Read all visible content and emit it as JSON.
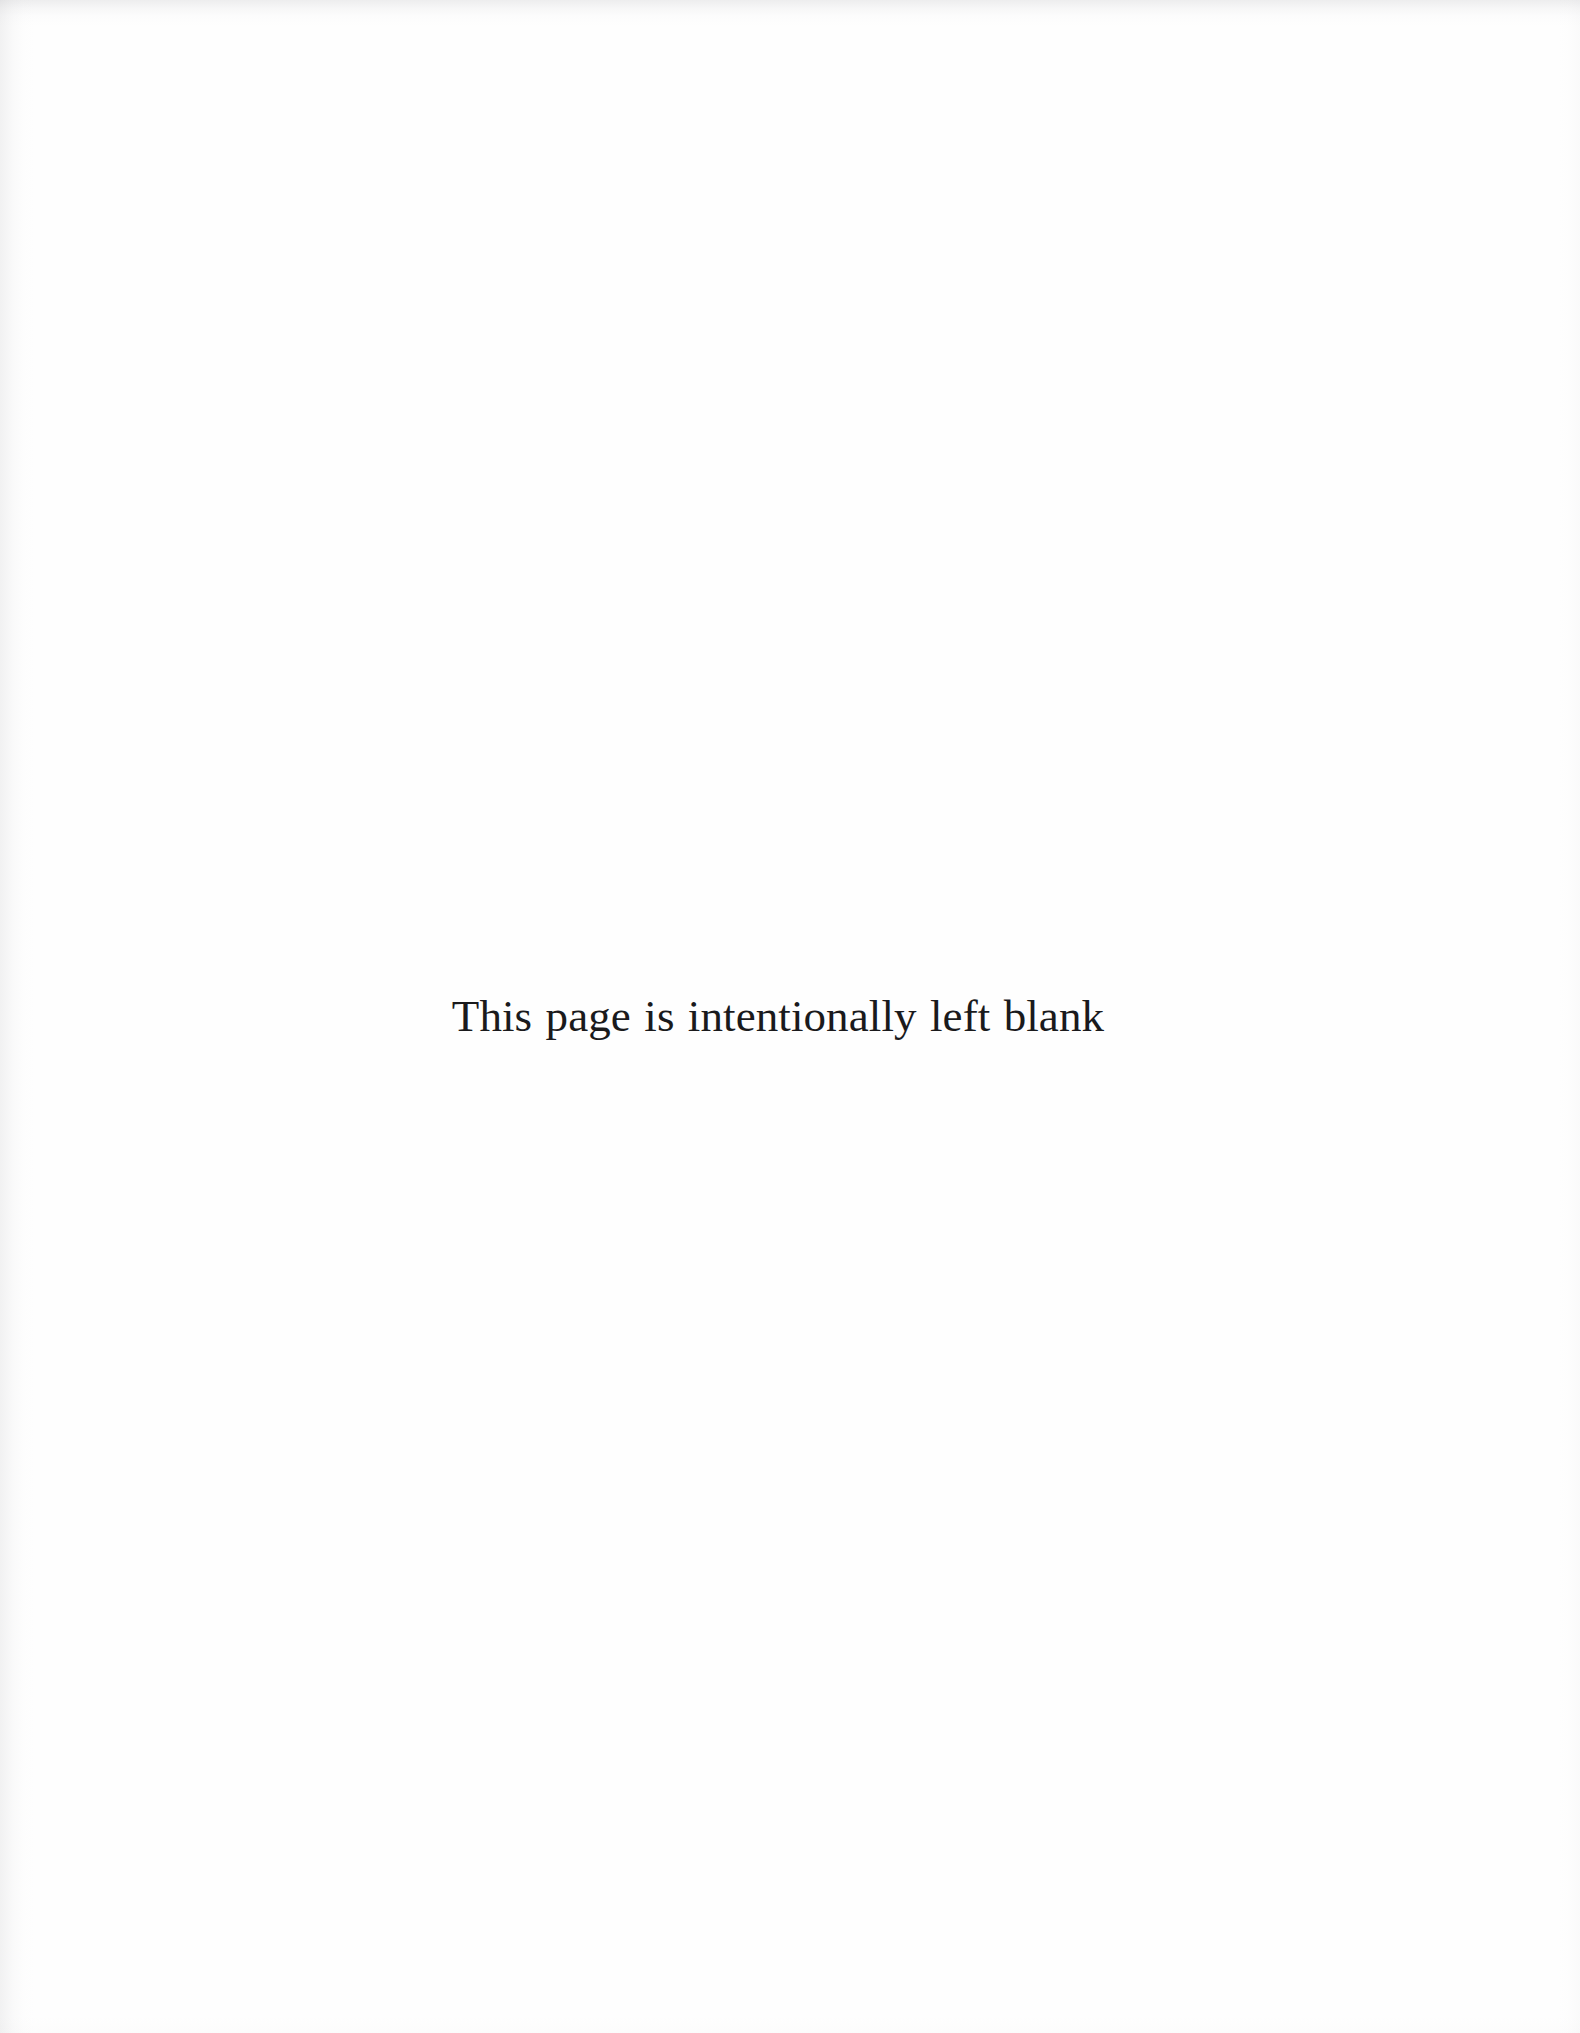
{
  "page": {
    "kind": "scanned-book-page",
    "width": 1580,
    "height": 2033,
    "background_color": "#fefefe",
    "ink_color": "#1a1a1c"
  },
  "content": {
    "blank_notice": "This page is intentionally left blank"
  },
  "artifacts": {
    "top_edge_shadow": "",
    "left_edge_shadow": "",
    "right_edge_shadow": "",
    "bottom_edge_shadow": ""
  }
}
